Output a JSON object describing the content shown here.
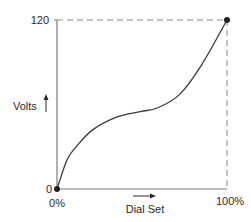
{
  "chart_data": {
    "type": "line",
    "title": "",
    "xlabel": "Dial Set",
    "ylabel": "Volts",
    "xlim": [
      0,
      100
    ],
    "ylim": [
      0,
      120
    ],
    "x_tick_labels": [
      "0%",
      "100%"
    ],
    "y_tick_labels": [
      "0",
      "120"
    ],
    "grid": false,
    "legend": null,
    "annotations": [
      "dashed reference lines from 120 V on y-axis and 100% on x-axis meeting at endpoint"
    ],
    "series": [
      {
        "name": "Volts vs Dial Set",
        "x": [
          0,
          6,
          12,
          21,
          35,
          49,
          59,
          72,
          85,
          100
        ],
        "y": [
          0,
          21,
          31,
          42,
          51,
          55,
          57.5,
          67,
          88,
          120
        ]
      }
    ],
    "markers": [
      {
        "x": 0,
        "y": 0
      },
      {
        "x": 100,
        "y": 120
      }
    ]
  },
  "labels": {
    "y_axis": "Volts",
    "x_axis": "Dial Set",
    "y_min": "0",
    "y_max": "120",
    "x_min": "0%",
    "x_max": "100%"
  },
  "colors": {
    "axis": "#7a7a7a",
    "curve": "#3a3a3a",
    "dash": "#8a8a8a",
    "marker": "#222222",
    "text": "#2a2a2a"
  }
}
